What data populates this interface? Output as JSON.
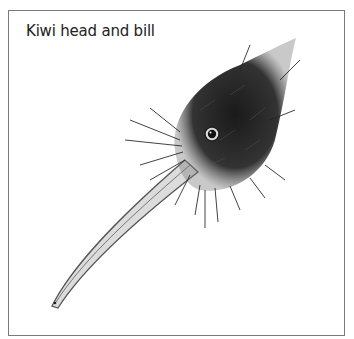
{
  "figure": {
    "caption": "Kiwi head and bill",
    "illustration": "kiwi-head-and-bill-drawing"
  }
}
